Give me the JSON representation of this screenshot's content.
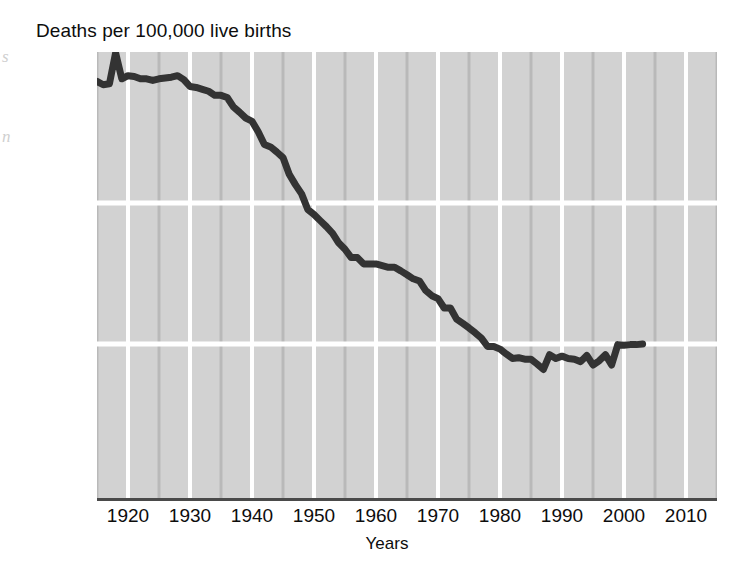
{
  "chart_data": {
    "type": "line",
    "title": "Deaths per 100,000 live births",
    "xlabel": "Years",
    "ylabel": "",
    "yscale": "log",
    "y_ticks": [
      {
        "label": "1,000",
        "value": 1000,
        "gridline": false
      },
      {
        "label": "100",
        "value": 100,
        "gridline": true
      },
      {
        "label": "10",
        "value": 10,
        "gridline": true
      },
      {
        "label": "0",
        "value": 0,
        "gridline": false
      }
    ],
    "x_ticks": [
      "1920",
      "1930",
      "1940",
      "1950",
      "1960",
      "1970",
      "1980",
      "1990",
      "2000",
      "2010"
    ],
    "xlim": [
      1915,
      2015
    ],
    "ylim": [
      3,
      1400
    ],
    "grid": true,
    "grid_major_color": "#ffffff",
    "grid_minor_color": "#b9b9b9",
    "plot_background": "#d2d2d2",
    "line_color": "#333333",
    "line_width": 7,
    "series": [
      {
        "name": "Maternal mortality rate",
        "x": [
          1915,
          1916,
          1917,
          1918,
          1919,
          1920,
          1921,
          1922,
          1923,
          1924,
          1925,
          1926,
          1927,
          1928,
          1929,
          1930,
          1931,
          1932,
          1933,
          1934,
          1935,
          1936,
          1937,
          1938,
          1939,
          1940,
          1941,
          1942,
          1943,
          1944,
          1945,
          1946,
          1947,
          1948,
          1949,
          1950,
          1951,
          1952,
          1953,
          1954,
          1955,
          1956,
          1957,
          1958,
          1959,
          1960,
          1961,
          1962,
          1963,
          1964,
          1965,
          1966,
          1967,
          1968,
          1969,
          1970,
          1971,
          1972,
          1973,
          1974,
          1975,
          1976,
          1977,
          1978,
          1979,
          1980,
          1981,
          1982,
          1983,
          1984,
          1985,
          1986,
          1987,
          1988,
          1989,
          1990,
          1991,
          1992,
          1993,
          1994,
          1995,
          1996,
          1997,
          1998,
          1999,
          2000,
          2001,
          2002,
          2003
        ],
        "y": [
          728,
          690,
          700,
          1160,
          760,
          800,
          790,
          760,
          760,
          740,
          760,
          770,
          780,
          800,
          750,
          670,
          660,
          640,
          620,
          580,
          580,
          560,
          480,
          440,
          400,
          380,
          320,
          260,
          250,
          230,
          210,
          160,
          135,
          116,
          90,
          83,
          75,
          68,
          61,
          52,
          47,
          41,
          41,
          37,
          37,
          37,
          36,
          35,
          35,
          33,
          31,
          29,
          28,
          24,
          22,
          21,
          18,
          18,
          15,
          14,
          13,
          12,
          11,
          9.6,
          9.6,
          9.2,
          8.5,
          7.9,
          8.0,
          7.8,
          7.8,
          7.2,
          6.6,
          8.4,
          7.9,
          8.2,
          7.9,
          7.8,
          7.5,
          8.3,
          7.1,
          7.6,
          8.4,
          7.1,
          9.9,
          9.8,
          9.9,
          9.9,
          10.0
        ]
      }
    ]
  },
  "artifacts": {
    "left_margin_marks": [
      "s",
      "n"
    ]
  }
}
